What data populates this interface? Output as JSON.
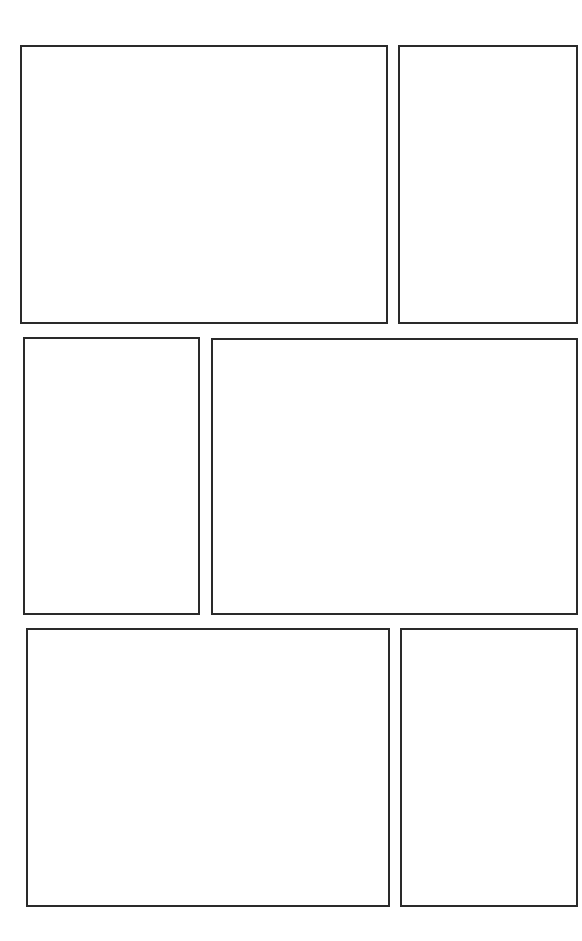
{
  "page": {
    "background": "#ffffff",
    "border_color": "#2a2a2a",
    "layout": "comic-page-template",
    "rows": [
      {
        "panels": [
          {
            "id": "panel-1",
            "x": 20,
            "y": 45,
            "w": 368,
            "h": 279
          },
          {
            "id": "panel-2",
            "x": 398,
            "y": 45,
            "w": 180,
            "h": 279
          }
        ]
      },
      {
        "panels": [
          {
            "id": "panel-3",
            "x": 23,
            "y": 337,
            "w": 177,
            "h": 278
          },
          {
            "id": "panel-4",
            "x": 211,
            "y": 338,
            "w": 367,
            "h": 277
          }
        ]
      },
      {
        "panels": [
          {
            "id": "panel-5",
            "x": 26,
            "y": 628,
            "w": 364,
            "h": 279
          },
          {
            "id": "panel-6",
            "x": 400,
            "y": 628,
            "w": 178,
            "h": 279
          }
        ]
      }
    ]
  }
}
